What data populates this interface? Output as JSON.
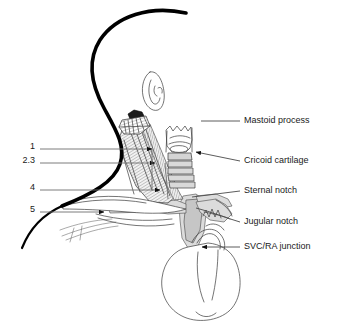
{
  "figure": {
    "background_color": "#ffffff",
    "line_color": "#000000",
    "shade_color": "#c8c8c8",
    "text_color": "#1a1a1a",
    "leader_color": "#4a4a4a"
  },
  "right_labels": [
    {
      "id": "mastoid-process",
      "text": "Mastoid process",
      "text_x": 244,
      "text_y": 121,
      "leader": {
        "x1": 201,
        "y1": 121,
        "x2": 240,
        "y2": 121,
        "arrow": false
      }
    },
    {
      "id": "cricoid-cartilage",
      "text": "Cricoid cartilage",
      "text_x": 244,
      "text_y": 158,
      "leader": {
        "x1": 192,
        "y1": 152,
        "x2": 240,
        "y2": 161,
        "arrow": true
      }
    },
    {
      "id": "sternal-notch",
      "text": "Sternal notch",
      "text_x": 244,
      "text_y": 191,
      "leader": {
        "x1": 192,
        "y1": 197,
        "x2": 240,
        "y2": 191,
        "arrow": false
      }
    },
    {
      "id": "jugular-notch",
      "text": "Jugular notch",
      "text_x": 244,
      "text_y": 222,
      "leader": {
        "x1": 196,
        "y1": 208,
        "x2": 240,
        "y2": 222,
        "arrow": false
      }
    },
    {
      "id": "svc-ra-junction",
      "text": "SVC/RA junction",
      "text_x": 244,
      "text_y": 247,
      "leader": {
        "x1": 213,
        "y1": 247,
        "x2": 240,
        "y2": 247,
        "arrow": false
      }
    }
  ],
  "left_markers": [
    {
      "id": "marker-1",
      "text": "1",
      "text_x": 35,
      "text_y": 147,
      "leader": {
        "x1": 38,
        "y1": 149,
        "x2": 152,
        "y2": 149
      },
      "arrow_x": 152,
      "arrow_y": 149
    },
    {
      "id": "marker-2-3",
      "text": "2.3",
      "text_x": 35,
      "text_y": 161,
      "leader": {
        "x1": 38,
        "y1": 163,
        "x2": 155,
        "y2": 163
      },
      "arrow_x": 155,
      "arrow_y": 163
    },
    {
      "id": "marker-4",
      "text": "4",
      "text_x": 35,
      "text_y": 188,
      "leader": {
        "x1": 38,
        "y1": 190,
        "x2": 160,
        "y2": 190
      },
      "arrow_x": 160,
      "arrow_y": 190
    },
    {
      "id": "marker-5",
      "text": "5",
      "text_x": 35,
      "text_y": 210,
      "leader": {
        "x1": 38,
        "y1": 212,
        "x2": 104,
        "y2": 212
      },
      "arrow_x": 104,
      "arrow_y": 212
    }
  ],
  "anatomy": {
    "head_profile": "thick black lateral head and neck contour",
    "ear": "thin line auricle outline",
    "mastoid_process": "striated triangular muscle origin at skull base",
    "sternocleidomastoid": "large striated neck muscle running to clavicle",
    "larynx_trachea": "cricoid cartilage with stacked tracheal rings",
    "clavicle": "horizontal bone crossing lower neck",
    "first_rib": "curved rib beneath clavicle",
    "great_vessels": "shaded superior vena cava and brachiocephalic veins",
    "heart": "outlined cardiac silhouette with aortic arch"
  }
}
